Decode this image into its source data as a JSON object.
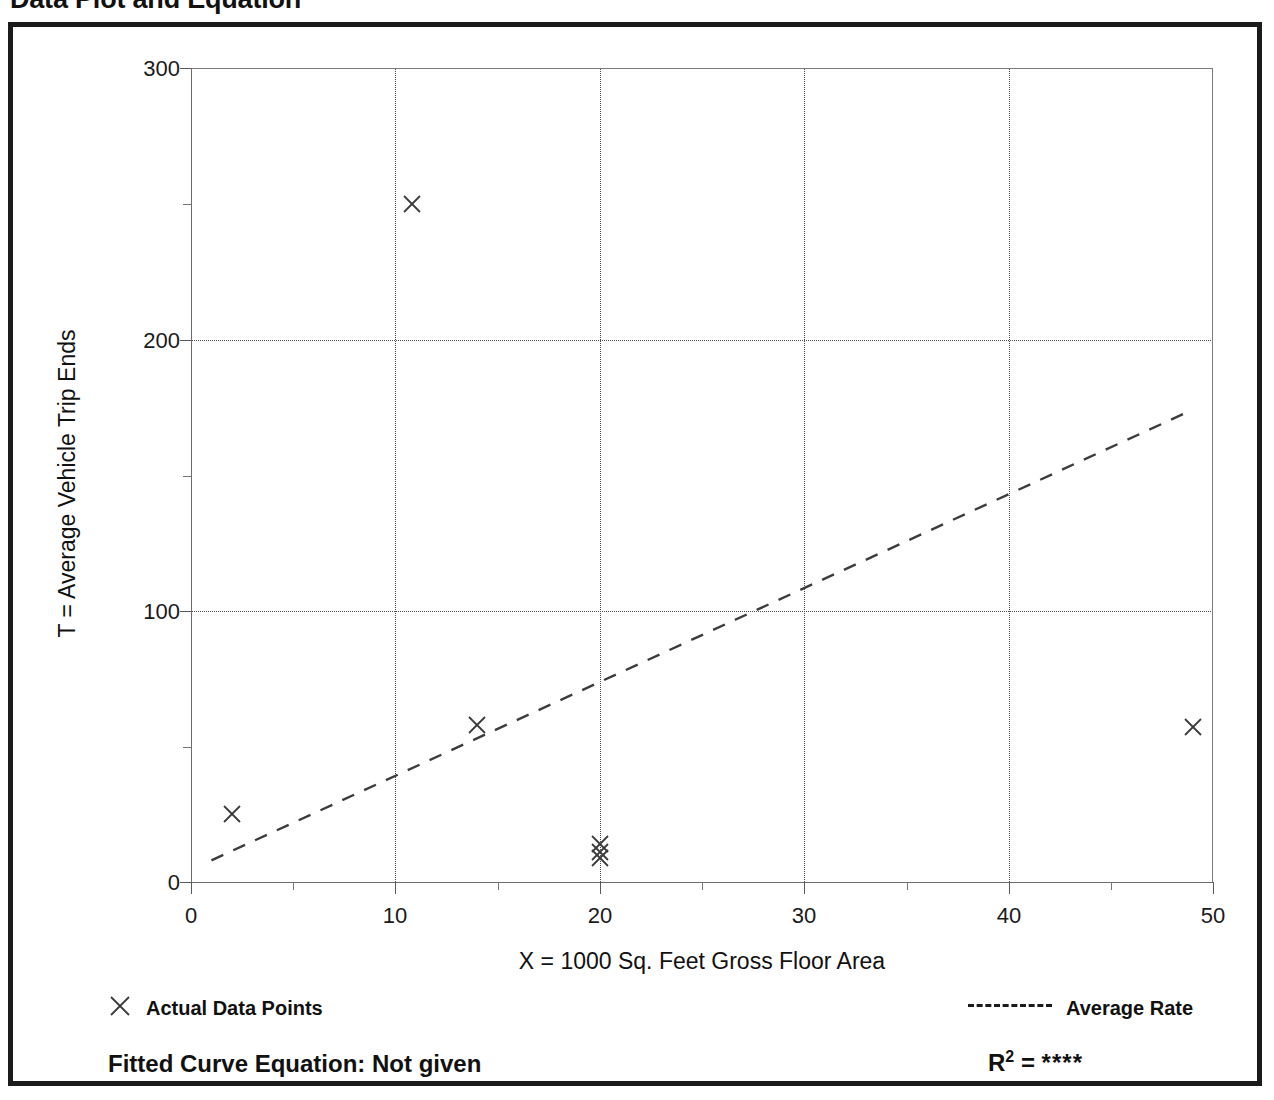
{
  "page_title": "Data Plot and Equation",
  "chart_data": {
    "type": "scatter",
    "title": "Data Plot and Equation",
    "xlabel": "X = 1000 Sq. Feet Gross Floor Area",
    "ylabel": "T = Average Vehicle Trip Ends",
    "xlim": [
      0,
      50
    ],
    "ylim": [
      0,
      300
    ],
    "xticks": [
      0,
      10,
      20,
      30,
      40,
      50
    ],
    "xtick_labels": [
      "0",
      "10",
      "20",
      "30",
      "40",
      "50"
    ],
    "xticks_minor": [
      5,
      15,
      25,
      35,
      45
    ],
    "yticks": [
      0,
      100,
      200,
      300
    ],
    "ytick_labels": [
      "0",
      "100",
      "200",
      "300"
    ],
    "yticks_minor": [
      50,
      150,
      250
    ],
    "grid": "dotted-both",
    "legend_position": "below-axes",
    "series": [
      {
        "name": "Actual Data Points",
        "type": "scatter",
        "marker": "x",
        "points": [
          {
            "x": 2.0,
            "y": 25
          },
          {
            "x": 10.8,
            "y": 250
          },
          {
            "x": 14.0,
            "y": 58
          },
          {
            "x": 20.0,
            "y": 14
          },
          {
            "x": 20.0,
            "y": 9
          },
          {
            "x": 20.0,
            "y": 11
          },
          {
            "x": 49.0,
            "y": 57
          }
        ]
      },
      {
        "name": "Average Rate",
        "type": "line",
        "style": "dashed",
        "endpoints": [
          {
            "x": 1.0,
            "y": 8
          },
          {
            "x": 48.7,
            "y": 173
          }
        ]
      }
    ]
  },
  "legend": {
    "points_marker": "x-marker-icon",
    "points_label": "Actual Data Points",
    "rate_line": "dashed-line-icon",
    "rate_label": "Average Rate"
  },
  "footer": {
    "equation_label": "Fitted Curve Equation:  Not given",
    "rsquared_symbol": "R",
    "rsquared_exponent": "2",
    "rsquared_equals": " = ",
    "rsquared_value": "****"
  }
}
